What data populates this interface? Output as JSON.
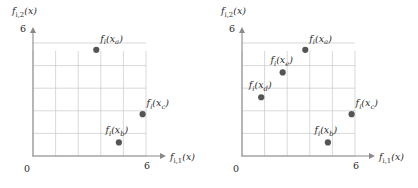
{
  "figure": {
    "background": "#ffffff",
    "marker_color": "#555555",
    "grid_color": "#c9c9c9",
    "axis_color": "#8a8a8a",
    "text_color": "#2b2b2b"
  },
  "chart_data": [
    {
      "type": "scatter",
      "panel": "left",
      "title": "",
      "xlabel": "f_{i,1}(x)",
      "ylabel": "f_{i,2}(x)",
      "xlim": [
        0,
        6
      ],
      "ylim": [
        0,
        6
      ],
      "xticks": [
        0,
        6
      ],
      "xticklabels": [
        "0",
        "6"
      ],
      "yticks": [
        0,
        6
      ],
      "yticklabels": [
        "0",
        "6"
      ],
      "grid": true,
      "grid_step": 1,
      "legend": "none",
      "points": [
        {
          "label": "f_i(x_a)",
          "base": "f",
          "isub": "i",
          "arg": "x",
          "asub": "a",
          "x": 2.8,
          "y": 4.7,
          "label_dx": 4,
          "label_dy": -8
        },
        {
          "label": "f_i(x_c)",
          "base": "f",
          "isub": "i",
          "arg": "x",
          "asub": "c",
          "x": 4.85,
          "y": 1.85,
          "label_dx": 4,
          "label_dy": -8
        },
        {
          "label": "f_i(x_b)",
          "base": "f",
          "isub": "i",
          "arg": "x",
          "asub": "b",
          "x": 3.8,
          "y": 0.6,
          "label_dx": -2,
          "label_dy": -9
        }
      ]
    },
    {
      "type": "scatter",
      "panel": "right",
      "title": "",
      "xlabel": "f_{i,1}(x)",
      "ylabel": "f_{i,2}(x)",
      "xlim": [
        0,
        6
      ],
      "ylim": [
        0,
        6
      ],
      "xticks": [
        0,
        6
      ],
      "xticklabels": [
        "0",
        "6"
      ],
      "yticks": [
        0,
        6
      ],
      "yticklabels": [
        "0",
        "6"
      ],
      "grid": true,
      "grid_step": 1,
      "legend": "none",
      "points": [
        {
          "label": "f_i(x_a)",
          "base": "f",
          "isub": "i",
          "arg": "x",
          "asub": "a",
          "x": 2.8,
          "y": 4.7,
          "label_dx": 4,
          "label_dy": -8
        },
        {
          "label": "f_i(x_e)",
          "base": "f",
          "isub": "i",
          "arg": "x",
          "asub": "e",
          "x": 1.8,
          "y": 3.7,
          "label_dx": -1,
          "label_dy": -9
        },
        {
          "label": "f_i(x_d)",
          "base": "f",
          "isub": "i",
          "arg": "x",
          "asub": "d",
          "x": 0.85,
          "y": 2.6,
          "label_dx": -1,
          "label_dy": -9
        },
        {
          "label": "f_i(x_c)",
          "base": "f",
          "isub": "i",
          "arg": "x",
          "asub": "c",
          "x": 4.85,
          "y": 1.85,
          "label_dx": 4,
          "label_dy": -8
        },
        {
          "label": "f_i(x_b)",
          "base": "f",
          "isub": "i",
          "arg": "x",
          "asub": "b",
          "x": 3.8,
          "y": 0.6,
          "label_dx": -2,
          "label_dy": -9
        }
      ]
    }
  ],
  "labels": {
    "x_axis_base": "f",
    "x_axis_sub": "i,1",
    "x_axis_arg": "(x)",
    "y_axis_base": "f",
    "y_axis_sub": "i,2",
    "y_axis_arg": "(x)",
    "origin": "0",
    "max": "6"
  }
}
